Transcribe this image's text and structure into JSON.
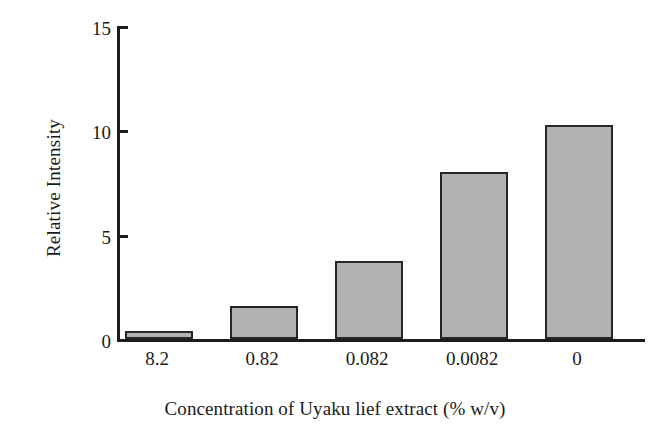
{
  "chart_data": {
    "type": "bar",
    "title": "",
    "xlabel": "Concentration of Uyaku lief extract (% w/v)",
    "ylabel": "Relative Intensity",
    "categories": [
      "8.2",
      "0.82",
      "0.082",
      "0.0082",
      "0"
    ],
    "values": [
      0.4,
      1.6,
      3.8,
      8.1,
      10.4
    ],
    "ylim": [
      0,
      15
    ],
    "yticks": [
      0,
      5,
      10,
      15
    ],
    "ytick_labels": [
      "0",
      "5",
      "10",
      "15"
    ],
    "grid": false,
    "legend": null,
    "bar_fill_color": "#b2b2b2",
    "bar_edge_color": "#262626",
    "axis_color": "#1c1c1c"
  }
}
